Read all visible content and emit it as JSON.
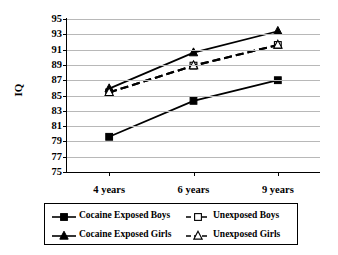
{
  "chart_data": {
    "type": "line",
    "title": "",
    "xlabel": "",
    "ylabel": "IQ",
    "categories": [
      "4 years",
      "6 years",
      "9 years"
    ],
    "ylim": [
      75,
      95
    ],
    "yticks": [
      75,
      77,
      79,
      81,
      83,
      85,
      87,
      89,
      91,
      93,
      95
    ],
    "grid": true,
    "legend_position": "bottom",
    "series": [
      {
        "name": "Cocaine Exposed Boys",
        "values": [
          79.6,
          84.3,
          87.0
        ],
        "marker": "filled-square",
        "line": "solid",
        "color": "#000000"
      },
      {
        "name": "Unexposed Boys",
        "values": [
          85.4,
          88.9,
          91.6
        ],
        "marker": "open-square",
        "line": "dashed",
        "color": "#000000"
      },
      {
        "name": "Cocaine Exposed Girls",
        "values": [
          85.9,
          90.6,
          93.4
        ],
        "marker": "filled-triangle",
        "line": "solid",
        "color": "#000000"
      },
      {
        "name": "Unexposed Girls",
        "values": [
          85.4,
          88.9,
          91.6
        ],
        "marker": "open-triangle",
        "line": "dashed",
        "color": "#000000"
      }
    ]
  },
  "axis": {
    "y_title": "IQ",
    "y_tick_labels": [
      "95",
      "93",
      "91",
      "89",
      "87",
      "85",
      "83",
      "81",
      "79",
      "77",
      "75"
    ],
    "x_tick_labels": [
      "4 years",
      "6 years",
      "9 years"
    ]
  },
  "legend": {
    "entries": [
      {
        "label": "Cocaine Exposed Boys",
        "marker": "filled-square",
        "line": "solid"
      },
      {
        "label": "Unexposed Boys",
        "marker": "open-square",
        "line": "dashed"
      },
      {
        "label": "Cocaine Exposed Girls",
        "marker": "filled-triangle",
        "line": "solid"
      },
      {
        "label": "Unexposed Girls",
        "marker": "open-triangle",
        "line": "dashed"
      }
    ]
  },
  "style": {
    "gridline_color": "#b8b8b8",
    "axis_color": "#000000",
    "background": "#ffffff"
  }
}
